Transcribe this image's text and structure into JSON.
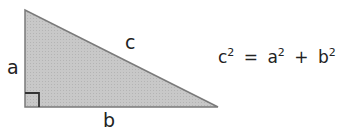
{
  "figure": {
    "type": "right-triangle",
    "fill_color": "#c8c8c8",
    "stroke_color": "#7a7a7a",
    "right_angle_marker_color": "#333333",
    "vertices": {
      "top": [
        25,
        10
      ],
      "bottom_left": [
        25,
        107
      ],
      "bottom_right": [
        218,
        107
      ]
    },
    "labels": {
      "side_a": "a",
      "side_b": "b",
      "side_c": "c"
    }
  },
  "formula": {
    "c": "c",
    "a": "a",
    "b": "b",
    "exponent": "2",
    "equals": "=",
    "plus": "+"
  }
}
